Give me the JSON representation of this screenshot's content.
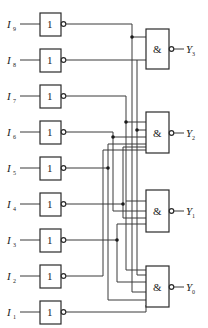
{
  "diagram": {
    "title": "",
    "colors": {
      "line": "#3a3a3a",
      "background": "#ffffff"
    },
    "inverters": [
      {
        "input": "I",
        "sub": "9",
        "symbol": "1",
        "cy": 24
      },
      {
        "input": "I",
        "sub": "8",
        "symbol": "1",
        "cy": 60
      },
      {
        "input": "I",
        "sub": "7",
        "symbol": "1",
        "cy": 96
      },
      {
        "input": "I",
        "sub": "6",
        "symbol": "1",
        "cy": 132
      },
      {
        "input": "I",
        "sub": "5",
        "symbol": "1",
        "cy": 168
      },
      {
        "input": "I",
        "sub": "4",
        "symbol": "1",
        "cy": 204
      },
      {
        "input": "I",
        "sub": "3",
        "symbol": "1",
        "cy": 240
      },
      {
        "input": "I",
        "sub": "2",
        "symbol": "1",
        "cy": 276
      },
      {
        "input": "I",
        "sub": "1",
        "symbol": "1",
        "cy": 312
      }
    ],
    "nand_gates": [
      {
        "output": "Y",
        "sub": "3",
        "symbol": "&",
        "top": 29,
        "bottom": 69
      },
      {
        "output": "Y",
        "sub": "2",
        "symbol": "&",
        "top": 112,
        "bottom": 153
      },
      {
        "output": "Y",
        "sub": "1",
        "symbol": "&",
        "top": 190,
        "bottom": 232
      },
      {
        "output": "Y",
        "sub": "0",
        "symbol": "&",
        "top": 266,
        "bottom": 307
      }
    ]
  }
}
